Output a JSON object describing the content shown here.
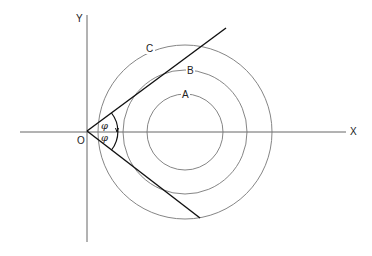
{
  "diagram": {
    "axes": {
      "x_label": "X",
      "y_label": "Y",
      "origin_label": "O"
    },
    "circles": [
      {
        "label": "A",
        "cx": 185,
        "cy": 132,
        "r": 38
      },
      {
        "label": "B",
        "cx": 185,
        "cy": 132,
        "r": 62
      },
      {
        "label": "C",
        "cx": 185,
        "cy": 132,
        "r": 87
      }
    ],
    "tangent_lines": [
      {
        "name": "upper",
        "from": [
          87,
          131
        ],
        "to": [
          226,
          28
        ]
      },
      {
        "name": "lower",
        "from": [
          87,
          131
        ],
        "to": [
          200,
          218
        ]
      }
    ],
    "angle_labels": [
      "φ",
      "φ"
    ],
    "colors": {
      "axis": "#555555",
      "circle": "#666666",
      "tangent": "#111111"
    }
  }
}
